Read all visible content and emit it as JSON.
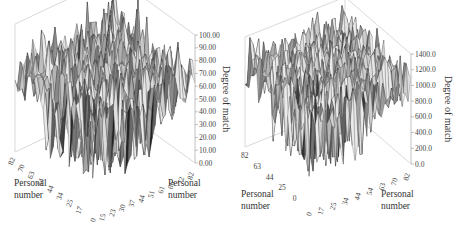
{
  "chart_data": [
    {
      "type": "surface3d",
      "title": "",
      "xlabel": "Personal number",
      "ylabel": "Personal number",
      "zlabel": "Degree of match",
      "x_ticks": [
        "0",
        "15",
        "23",
        "30",
        "37",
        "44",
        "51",
        "61",
        "66",
        "72",
        "82"
      ],
      "y_ticks": [
        "17",
        "25",
        "34",
        "44",
        "54",
        "63",
        "70",
        "82"
      ],
      "z_ticks": [
        "0.00",
        "10.00",
        "20.00",
        "30.00",
        "40.00",
        "50.00",
        "60.00",
        "70.00",
        "80.00",
        "90.00",
        "100.00"
      ],
      "zlim": [
        0,
        100
      ],
      "surface": {
        "baseline": 60,
        "noise_amplitude": 22,
        "diagonal_peak": 100,
        "min_dips": 15,
        "colormap": "grayscale"
      },
      "grid": false
    },
    {
      "type": "surface3d",
      "title": "",
      "xlabel": "Personal number",
      "ylabel": "Personal number",
      "zlabel": "Degree of match",
      "x_ticks": [
        "0",
        "17",
        "25",
        "34",
        "44",
        "54",
        "63",
        "70",
        "82"
      ],
      "y_ticks": [
        "0",
        "25",
        "44",
        "63",
        "82"
      ],
      "z_ticks": [
        "0.0",
        "200.0",
        "400.0",
        "600.0",
        "800.0",
        "1000.0",
        "1200.0",
        "1400.0"
      ],
      "zlim": [
        0,
        1400
      ],
      "surface": {
        "baseline": 1000,
        "noise_amplitude": 300,
        "diagonal_peak": null,
        "min_dips": 300,
        "colormap": "grayscale"
      },
      "grid": false
    }
  ]
}
